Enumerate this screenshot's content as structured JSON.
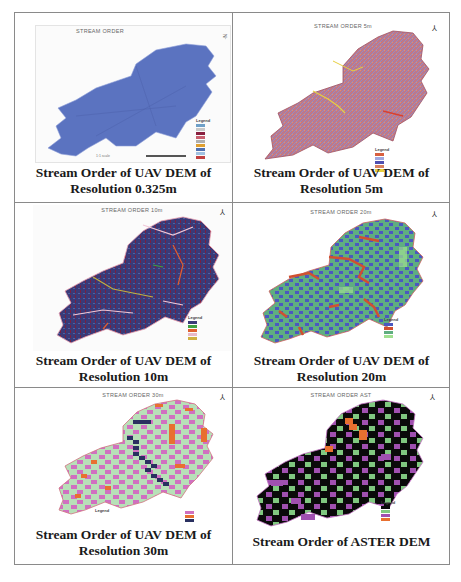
{
  "figure": {
    "panels": [
      {
        "id": "p1",
        "map_title": "STREAM ORDER",
        "caption_line1": "Stream Order of  UAV DEM of",
        "caption_line2": "Resolution 0.325m",
        "base_color": "#5b73c0",
        "legend_title": "Legend",
        "legend_colors": [
          "#6fa0c8",
          "#c8c8c8",
          "#8a2040",
          "#c86070",
          "#b0b0b0",
          "#e0a030",
          "#5070b0",
          "#a0c0e0",
          "#c04040"
        ],
        "scale_text": "1:1 scale",
        "north_arrow": "N"
      },
      {
        "id": "p2",
        "map_title": "STREAM ORDER 5m",
        "caption_line1": "Stream Order of  UAV DEM of",
        "caption_line2": "Resolution 5m",
        "base_color": "#b07890",
        "legend_title": "Legend",
        "legend_colors": [
          "#d86040",
          "#a0a8e0",
          "#5050b0",
          "#d88060",
          "#e8d040"
        ],
        "north_arrow": "N"
      },
      {
        "id": "p3",
        "map_title": "STREAM ORDER 10m",
        "caption_line1": "Stream Order of  UAV DEM of",
        "caption_line2": "Resolution 10m",
        "base_color": "#3a3a78",
        "legend_title": "Legend",
        "legend_colors": [
          "#3a3a78",
          "#40a040",
          "#e06030",
          "#e8b8c8",
          "#d0b040"
        ],
        "north_arrow": "N"
      },
      {
        "id": "p4",
        "map_title": "STREAM ORDER 20m",
        "caption_line1": "Stream Order of  UAV DEM of",
        "caption_line2": "Resolution 20m",
        "base_color": "#5fae80",
        "legend_title": "Legend",
        "legend_colors": [
          "#4a58c0",
          "#d05030",
          "#5fae80",
          "#a0e090"
        ],
        "north_arrow": "N"
      },
      {
        "id": "p5",
        "map_title": "STREAM ORDER 30m",
        "caption_line1": "Stream Order of  UAV DEM of",
        "caption_line2": "Resolution 30m",
        "base_color": "#b8e0b8",
        "legend_title": "Legend",
        "legend_colors": [
          "#d070c0",
          "#e87030",
          "#2a3060"
        ],
        "north_arrow": "N"
      },
      {
        "id": "p6",
        "map_title": "STREAM ORDER AST",
        "caption_line1": "Stream Order of ASTER DEM",
        "caption_line2": "",
        "base_color": "#0a0a0a",
        "legend_title": "Legend",
        "legend_colors": [
          "#0a0a0a",
          "#80c880",
          "#a050b0",
          "#e87030"
        ],
        "north_arrow": "N"
      }
    ]
  }
}
